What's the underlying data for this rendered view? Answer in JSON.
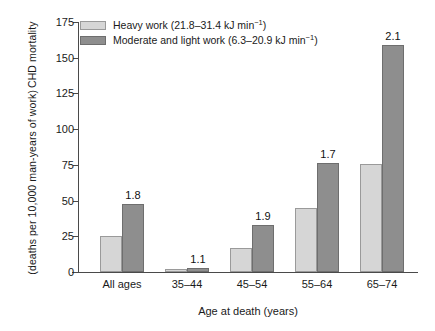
{
  "chart_data": {
    "type": "bar",
    "title": "",
    "xlabel": "Age at death (years)",
    "ylabel_line1": "CHD mortality",
    "ylabel_line2": "(deaths per 10,000 man-years of work)",
    "ylim": [
      0,
      175
    ],
    "ytick_values": [
      0,
      25,
      50,
      75,
      100,
      125,
      150,
      175
    ],
    "ytick_labels": [
      "0",
      "25",
      "50",
      "75",
      "100",
      "125",
      "150",
      "175"
    ],
    "grid": false,
    "legend_position": "top-left",
    "categories": [
      "All ages",
      "35–44",
      "45–54",
      "55–64",
      "65–74"
    ],
    "series": [
      {
        "name": "Heavy work (21.8–31.4 kJ min⁻¹)",
        "color": "#d6d6d6",
        "values": [
          25.5,
          2.0,
          17.0,
          45.0,
          75.5
        ]
      },
      {
        "name": "Moderate and light work (6.3–20.9 kJ min⁻¹)",
        "color": "#8e8e8e",
        "values": [
          47.5,
          3.0,
          33.0,
          76.5,
          159.0
        ]
      }
    ],
    "annotations": [
      "1.8",
      "1.1",
      "1.9",
      "1.7",
      "2.1"
    ],
    "annotation_note": "ratio of moderate-and-light-work rate to heavy-work rate, shown above each dark bar"
  },
  "legend": {
    "items": [
      {
        "swatch": "light",
        "text_before": "Heavy work (21.8–31.4 kJ min",
        "sup": "−1",
        "text_after": ")"
      },
      {
        "swatch": "dark",
        "text_before": "Moderate and light work (6.3–20.9 kJ min",
        "sup": "−1",
        "text_after": ")"
      }
    ]
  },
  "axes": {
    "x_title": "Age at death (years)",
    "y_title_line1": "CHD mortality",
    "y_title_line2": "(deaths per 10,000 man-years of work)"
  }
}
